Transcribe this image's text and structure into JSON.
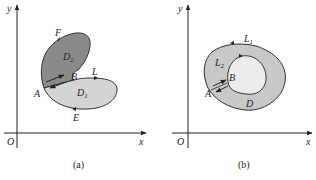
{
  "panel_a": {
    "caption": "(a)",
    "axes": {
      "x": "x",
      "y": "y",
      "origin": "O"
    },
    "labels": {
      "F": "F",
      "B": "B",
      "L": "L",
      "A": "A",
      "E": "E",
      "D2": "D",
      "D2_sub": "2",
      "D1": "D",
      "D1_sub": "1"
    },
    "colors": {
      "D2_fill": "#8a8a8a",
      "D1_fill": "#d4d4d4",
      "stroke": "#333333"
    }
  },
  "panel_b": {
    "caption": "(b)",
    "axes": {
      "x": "x",
      "y": "y",
      "origin": "O"
    },
    "labels": {
      "L1": "L",
      "L1_sub": "1",
      "L2": "L",
      "L2_sub": "2",
      "B": "B",
      "A": "A",
      "D": "D"
    },
    "colors": {
      "ring_fill": "#c8c8c8",
      "hole_fill": "#ececec",
      "stroke": "#333333"
    }
  }
}
